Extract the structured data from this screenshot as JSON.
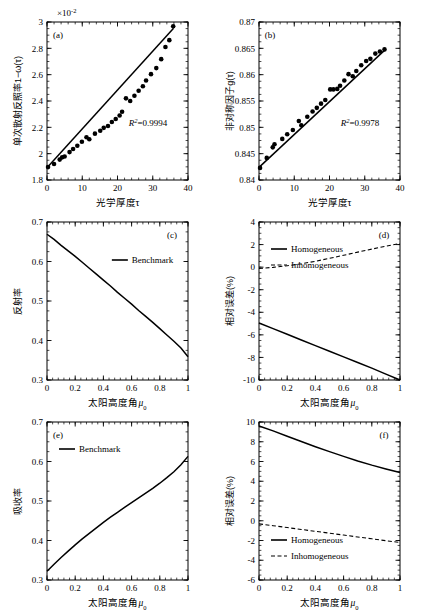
{
  "figure": {
    "width": 423,
    "height": 610,
    "background": "#ffffff",
    "line_color": "#000000",
    "marker_color": "#000000"
  },
  "chart_data": [
    {
      "id": "a",
      "type": "scatter",
      "tag": "(a)",
      "title": "",
      "xlabel": "光学厚度τ",
      "ylabel": "单次散射反照率1−ω(τ)",
      "sci_note": "×10",
      "sci_exp": "-2",
      "annotation": "R2=0.9994",
      "annotation_r": "R",
      "annotation_sup": "2",
      "annotation_rest": "=0.9994",
      "xlim": [
        0,
        40
      ],
      "ylim": [
        1.8,
        3.0
      ],
      "xticks": [
        0,
        10,
        20,
        30,
        40
      ],
      "xticklabels": [
        "0",
        "10",
        "20",
        "30",
        "40"
      ],
      "yticks": [
        1.8,
        2.0,
        2.2,
        2.4,
        2.6,
        2.8,
        3.0
      ],
      "yticklabels": [
        "1.8",
        "2",
        "2.2",
        "2.4",
        "2.6",
        "2.8",
        "3"
      ],
      "grid": false,
      "series": [
        {
          "name": "points",
          "style": "markers",
          "x": [
            0.3,
            2.0,
            3.6,
            4.3,
            5.0,
            6.4,
            7.4,
            8.6,
            9.9,
            11.2,
            12.0,
            13.6,
            15.1,
            16.1,
            17.3,
            18.4,
            19.5,
            20.6,
            21.3,
            22.4,
            23.6,
            24.8,
            26.0,
            27.2,
            28.1,
            29.5,
            31.0,
            32.4,
            33.6,
            34.7,
            35.8
          ],
          "y": [
            1.898,
            1.922,
            1.955,
            1.972,
            1.978,
            2.012,
            2.036,
            2.06,
            2.09,
            2.125,
            2.11,
            2.152,
            2.174,
            2.196,
            2.21,
            2.24,
            2.263,
            2.29,
            2.318,
            2.42,
            2.4,
            2.44,
            2.478,
            2.512,
            2.556,
            2.604,
            2.65,
            2.718,
            2.81,
            2.862,
            2.968
          ]
        },
        {
          "name": "fit",
          "style": "line",
          "x": [
            0.0,
            35.9
          ],
          "y": [
            1.893,
            2.953
          ]
        }
      ]
    },
    {
      "id": "b",
      "type": "scatter",
      "tag": "(b)",
      "title": "",
      "xlabel": "光学厚度τ",
      "ylabel": "非对称因子g(τ)",
      "annotation_r": "R",
      "annotation_sup": "2",
      "annotation_rest": "=0.9978",
      "xlim": [
        0,
        40
      ],
      "ylim": [
        0.84,
        0.87
      ],
      "xticks": [
        0,
        10,
        20,
        30,
        40
      ],
      "xticklabels": [
        "0",
        "10",
        "20",
        "30",
        "40"
      ],
      "yticks": [
        0.84,
        0.845,
        0.85,
        0.855,
        0.86,
        0.865,
        0.87
      ],
      "yticklabels": [
        "0.84",
        "0.845",
        "0.85",
        "0.855",
        "0.86",
        "0.865",
        "0.87"
      ],
      "grid": false,
      "series": [
        {
          "name": "points",
          "style": "markers",
          "x": [
            0.3,
            2.2,
            3.9,
            4.4,
            6.6,
            8.0,
            9.6,
            11.3,
            12.0,
            13.7,
            15.2,
            16.4,
            17.6,
            18.8,
            20.2,
            21.1,
            22.2,
            23.0,
            24.2,
            25.4,
            26.6,
            27.6,
            29.0,
            30.4,
            31.6,
            33.0,
            34.3,
            35.6
          ],
          "y": [
            0.8423,
            0.8442,
            0.8462,
            0.8468,
            0.8478,
            0.8487,
            0.8495,
            0.8512,
            0.8504,
            0.852,
            0.853,
            0.8537,
            0.8545,
            0.8552,
            0.8572,
            0.8572,
            0.8573,
            0.8579,
            0.8589,
            0.8601,
            0.8597,
            0.8607,
            0.8618,
            0.8626,
            0.863,
            0.864,
            0.8644,
            0.8648
          ]
        },
        {
          "name": "fit",
          "style": "line",
          "x": [
            0.0,
            35.9
          ],
          "y": [
            0.8424,
            0.8648
          ]
        }
      ]
    },
    {
      "id": "c",
      "type": "line",
      "tag": "(c)",
      "title": "",
      "xlabel": "太阳高度角μ0",
      "xlabel_main": "太阳高度角",
      "xlabel_sym": "μ",
      "xlabel_sub": "0",
      "ylabel": "反射率",
      "xlim": [
        0,
        1
      ],
      "ylim": [
        0.3,
        0.7
      ],
      "xticks": [
        0,
        0.2,
        0.4,
        0.6,
        0.8,
        1.0
      ],
      "xticklabels": [
        "0",
        "0.2",
        "0.4",
        "0.6",
        "0.8",
        "1"
      ],
      "yticks": [
        0.3,
        0.4,
        0.5,
        0.6,
        0.7
      ],
      "yticklabels": [
        "0.3",
        "0.4",
        "0.5",
        "0.6",
        "0.7"
      ],
      "grid": false,
      "legend": [
        "Benchmark"
      ],
      "legend_position": "upper-right-inside",
      "series": [
        {
          "name": "Benchmark",
          "style": "solid",
          "x": [
            0.0,
            0.05,
            0.1,
            0.15,
            0.2,
            0.25,
            0.3,
            0.35,
            0.4,
            0.45,
            0.5,
            0.55,
            0.6,
            0.65,
            0.7,
            0.75,
            0.8,
            0.85,
            0.9,
            0.95,
            1.0
          ],
          "y": [
            0.669,
            0.656,
            0.641,
            0.627,
            0.613,
            0.598,
            0.583,
            0.568,
            0.553,
            0.538,
            0.522,
            0.507,
            0.492,
            0.476,
            0.461,
            0.446,
            0.43,
            0.414,
            0.398,
            0.381,
            0.359
          ]
        }
      ]
    },
    {
      "id": "d",
      "type": "line",
      "tag": "(d)",
      "title": "",
      "xlabel_main": "太阳高度角",
      "xlabel_sym": "μ",
      "xlabel_sub": "0",
      "ylabel": "相对误差(%)",
      "xlim": [
        0,
        1
      ],
      "ylim": [
        -10,
        4
      ],
      "xticks": [
        0,
        0.2,
        0.4,
        0.6,
        0.8,
        1.0
      ],
      "xticklabels": [
        "0",
        "0.2",
        "0.4",
        "0.6",
        "0.8",
        "1"
      ],
      "yticks": [
        -10,
        -8,
        -6,
        -4,
        -2,
        0,
        2,
        4
      ],
      "yticklabels": [
        "-10",
        "-8",
        "-6",
        "-4",
        "-2",
        "0",
        "2",
        "4"
      ],
      "grid": false,
      "legend": [
        "Homogeneous",
        "Inhomogeneous"
      ],
      "legend_position": "upper-left-inside",
      "series": [
        {
          "name": "Homogeneous",
          "style": "solid",
          "x": [
            0.0,
            0.1,
            0.2,
            0.3,
            0.4,
            0.5,
            0.6,
            0.7,
            0.8,
            0.9,
            1.0
          ],
          "y": [
            -4.95,
            -5.45,
            -5.95,
            -6.45,
            -6.95,
            -7.45,
            -7.95,
            -8.45,
            -8.95,
            -9.48,
            -10.0
          ]
        },
        {
          "name": "Inhomogeneous",
          "style": "dashed",
          "x": [
            0.0,
            0.1,
            0.2,
            0.3,
            0.4,
            0.5,
            0.6,
            0.7,
            0.8,
            0.9,
            1.0
          ],
          "y": [
            -0.12,
            -0.02,
            0.12,
            0.3,
            0.52,
            0.78,
            1.05,
            1.33,
            1.6,
            1.86,
            2.1
          ]
        }
      ]
    },
    {
      "id": "e",
      "type": "line",
      "tag": "(e)",
      "title": "",
      "xlabel_main": "太阳高度角",
      "xlabel_sym": "μ",
      "xlabel_sub": "0",
      "ylabel": "吸收率",
      "xlim": [
        0,
        1
      ],
      "ylim": [
        0.3,
        0.7
      ],
      "xticks": [
        0,
        0.2,
        0.4,
        0.6,
        0.8,
        1.0
      ],
      "xticklabels": [
        "0",
        "0.2",
        "0.4",
        "0.6",
        "0.8",
        "1"
      ],
      "yticks": [
        0.3,
        0.4,
        0.5,
        0.6,
        0.7
      ],
      "yticklabels": [
        "0.3",
        "0.4",
        "0.5",
        "0.6",
        "0.7"
      ],
      "grid": false,
      "legend": [
        "Benchmark"
      ],
      "legend_position": "upper-left-inside",
      "series": [
        {
          "name": "Benchmark",
          "style": "solid",
          "x": [
            0.0,
            0.05,
            0.1,
            0.15,
            0.2,
            0.25,
            0.3,
            0.35,
            0.4,
            0.45,
            0.5,
            0.55,
            0.6,
            0.65,
            0.7,
            0.75,
            0.8,
            0.85,
            0.9,
            0.95,
            1.0
          ],
          "y": [
            0.322,
            0.34,
            0.357,
            0.373,
            0.389,
            0.404,
            0.418,
            0.432,
            0.446,
            0.459,
            0.471,
            0.484,
            0.496,
            0.508,
            0.52,
            0.532,
            0.545,
            0.559,
            0.574,
            0.592,
            0.613
          ]
        }
      ]
    },
    {
      "id": "f",
      "type": "line",
      "tag": "(f)",
      "title": "",
      "xlabel_main": "太阳高度角",
      "xlabel_sym": "μ",
      "xlabel_sub": "0",
      "ylabel": "相对误差(%)",
      "xlim": [
        0,
        1
      ],
      "ylim": [
        -6,
        10
      ],
      "xticks": [
        0,
        0.2,
        0.4,
        0.6,
        0.8,
        1.0
      ],
      "xticklabels": [
        "0",
        "0.2",
        "0.4",
        "0.6",
        "0.8",
        "1"
      ],
      "yticks": [
        -6,
        -4,
        -2,
        0,
        2,
        4,
        6,
        8,
        10
      ],
      "yticklabels": [
        "-6",
        "-4",
        "-2",
        "0",
        "2",
        "4",
        "6",
        "8",
        "10"
      ],
      "grid": false,
      "legend": [
        "Homogeneous",
        "Inhomogeneous"
      ],
      "legend_position": "lower-left-inside",
      "series": [
        {
          "name": "Homogeneous",
          "style": "solid",
          "x": [
            0.0,
            0.1,
            0.2,
            0.3,
            0.4,
            0.5,
            0.6,
            0.7,
            0.8,
            0.9,
            1.0
          ],
          "y": [
            9.6,
            9.1,
            8.55,
            8.02,
            7.5,
            7.0,
            6.52,
            6.05,
            5.63,
            5.25,
            4.88
          ]
        },
        {
          "name": "Inhomogeneous",
          "style": "dashed",
          "x": [
            0.0,
            0.1,
            0.2,
            0.3,
            0.4,
            0.5,
            0.6,
            0.7,
            0.8,
            0.9,
            1.0
          ],
          "y": [
            -0.32,
            -0.5,
            -0.69,
            -0.88,
            -1.07,
            -1.26,
            -1.45,
            -1.64,
            -1.83,
            -2.02,
            -2.2
          ]
        }
      ]
    }
  ]
}
